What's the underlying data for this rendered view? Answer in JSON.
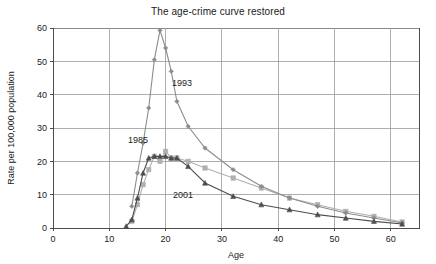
{
  "chart_data": {
    "type": "line",
    "title": "The age-crime curve restored",
    "xlabel": "Age",
    "ylabel": "Rate per 100,000 population",
    "xlim": [
      0,
      65
    ],
    "ylim": [
      0,
      60
    ],
    "xticks": [
      0,
      10,
      20,
      30,
      40,
      50,
      60
    ],
    "yticks": [
      0,
      10,
      20,
      30,
      40,
      50,
      60
    ],
    "grid": true,
    "legend_position": "inline-annotations",
    "series": [
      {
        "name": "1993",
        "color": "#8c8c8c",
        "marker": "diamond",
        "annotation": "1993",
        "x": [
          14,
          15,
          16,
          17,
          18,
          19,
          20,
          21,
          22,
          24,
          27,
          32,
          37,
          42,
          47,
          52,
          57,
          62
        ],
        "y": [
          6.5,
          16.5,
          25.5,
          36.0,
          50.5,
          59.3,
          54.0,
          47.0,
          38.0,
          30.5,
          24.0,
          17.5,
          12.5,
          9.0,
          6.5,
          4.5,
          3.0,
          1.5
        ]
      },
      {
        "name": "1985",
        "color": "#b0b0b0",
        "marker": "square",
        "annotation": "1985",
        "x": [
          14,
          15,
          16,
          17,
          18,
          19,
          20,
          21,
          22,
          24,
          27,
          32,
          37,
          42,
          47,
          52,
          57,
          62
        ],
        "y": [
          2.0,
          7.0,
          13.0,
          17.5,
          21.5,
          20.0,
          23.0,
          21.0,
          21.0,
          20.0,
          18.0,
          15.0,
          12.0,
          9.0,
          7.0,
          5.0,
          3.5,
          1.8
        ]
      },
      {
        "name": "2001",
        "color": "#4d4d4d",
        "marker": "triangle",
        "annotation": "2001",
        "x": [
          13,
          14,
          15,
          16,
          17,
          18,
          19,
          20,
          21,
          22,
          24,
          27,
          32,
          37,
          42,
          47,
          52,
          57,
          62
        ],
        "y": [
          0.5,
          2.5,
          9.0,
          16.5,
          21.0,
          21.5,
          21.5,
          21.5,
          21.0,
          21.0,
          18.5,
          13.5,
          9.5,
          7.0,
          5.5,
          4.0,
          3.0,
          2.0,
          1.2
        ]
      }
    ]
  },
  "colors": {
    "background": "#ffffff",
    "grid": "#9a9a9a",
    "axis": "#4d4d4d",
    "text": "#1a1a1a"
  }
}
